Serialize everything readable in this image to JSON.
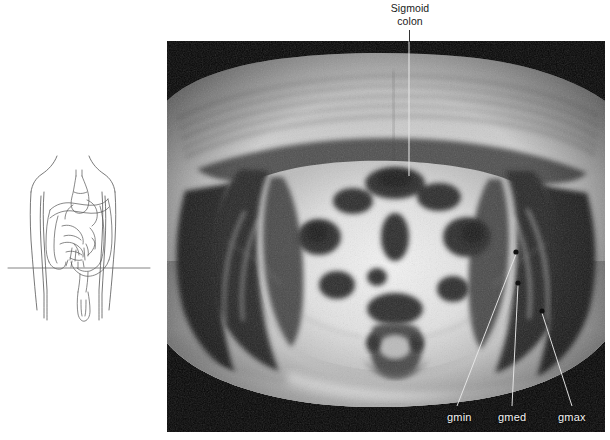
{
  "figure": {
    "type": "axial-pelvic-mri-with-orientation-diagram",
    "modality": "MRI",
    "plane": "axial",
    "region": "pelvis",
    "weighting_appearance": "bright subcutaneous fat, dark skeletal muscle"
  },
  "annotations": {
    "sigmoid": {
      "line1": "Sigmoid",
      "line2": "colon",
      "leader": {
        "orientation": "vertical",
        "x": 409,
        "y_start": 30,
        "y_end": 176,
        "style": "thin line, white over image, dark over page margin"
      }
    },
    "gluteal_muscles": [
      {
        "label": "gmin",
        "meaning": "gluteus minimus",
        "label_x": 447,
        "label_y": 411,
        "marker_x": 516,
        "marker_y": 252
      },
      {
        "label": "gmed",
        "meaning": "gluteus medius",
        "label_x": 498,
        "label_y": 411,
        "marker_x": 518,
        "marker_y": 283
      },
      {
        "label": "gmax",
        "meaning": "gluteus maximus",
        "label_x": 558,
        "label_y": 411,
        "marker_x": 542,
        "marker_y": 311
      }
    ]
  },
  "orientation_diagram": {
    "description": "line drawing of anterior torso with gastrointestinal tract and a horizontal line marking the axial section level",
    "section_line": {
      "x_start": 8,
      "x_end": 150,
      "y": 268
    },
    "stroke_color": "#555555",
    "structures": [
      "torso outline",
      "arms",
      "stomach",
      "transverse colon",
      "ascending colon",
      "descending colon",
      "small bowel",
      "sigmoid colon",
      "rectum"
    ]
  },
  "mri_panel": {
    "x": 167,
    "y": 41,
    "width": 438,
    "height": 391,
    "background_color": "#000000",
    "visible_structures": [
      "subcutaneous fat",
      "anterior abdominal wall",
      "iliac bones",
      "sacrum",
      "gluteus minimus",
      "gluteus medius",
      "gluteus maximus",
      "iliacus",
      "sigmoid colon",
      "bowel loops"
    ]
  }
}
